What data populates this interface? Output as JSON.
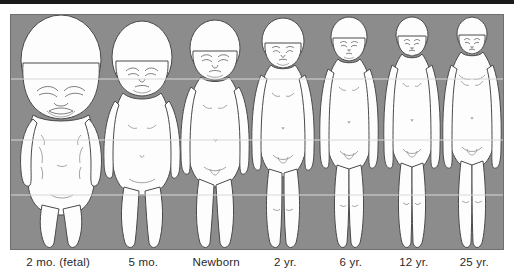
{
  "image": {
    "kind": "human-growth-proportion-diagram",
    "subject": "Changes in body proportions from fetal stage to adulthood",
    "background_color": "#8c8c8c",
    "figure_color": "#fdfdfd",
    "outline_color": "#4a4a4a",
    "reference_line_color": "#d8d8d8",
    "top_bar_color": "#1b1b1b",
    "label_color": "#2a2a2a"
  },
  "panel": {
    "reference_lines": [
      {
        "name": "line-1-chin-level",
        "y_fraction": 0.275
      },
      {
        "name": "line-2-chest-level",
        "y_fraction": 0.535
      },
      {
        "name": "line-3-hip-level",
        "y_fraction": 0.77
      }
    ]
  },
  "stages": [
    {
      "id": "stage-2mo-fetal",
      "label": "2 mo. (fetal)",
      "head_fraction_of_height": 0.5,
      "column_width_pct": 19.5
    },
    {
      "id": "stage-5mo",
      "label": "5 mo.",
      "head_fraction_of_height": 0.33,
      "column_width_pct": 15.0
    },
    {
      "id": "stage-newborn",
      "label": "Newborn",
      "head_fraction_of_height": 0.25,
      "column_width_pct": 14.5
    },
    {
      "id": "stage-2yr",
      "label": "2 yr.",
      "head_fraction_of_height": 0.2,
      "column_width_pct": 13.5
    },
    {
      "id": "stage-6yr",
      "label": "6 yr.",
      "head_fraction_of_height": 0.167,
      "column_width_pct": 13.0
    },
    {
      "id": "stage-12yr",
      "label": "12 yr.",
      "head_fraction_of_height": 0.143,
      "column_width_pct": 12.5
    },
    {
      "id": "stage-25yr",
      "label": "25 yr.",
      "head_fraction_of_height": 0.125,
      "column_width_pct": 12.0
    }
  ]
}
